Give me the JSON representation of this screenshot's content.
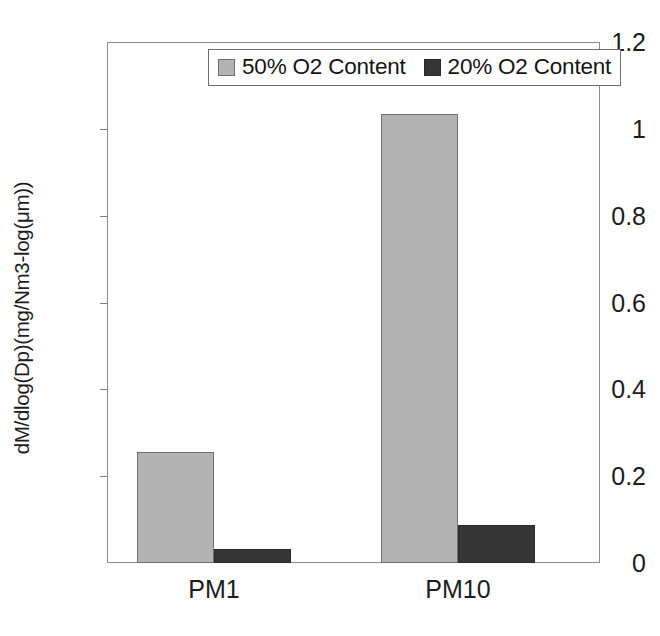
{
  "chart_data": {
    "type": "bar",
    "title": "",
    "xlabel": "",
    "ylabel": "dM/dlog(Dp)(mg/Nm3-log(μm))",
    "categories": [
      "PM1",
      "PM10"
    ],
    "series": [
      {
        "name": "50% O2 Content",
        "color": "#b3b3b3",
        "values": [
          0.255,
          1.035
        ]
      },
      {
        "name": "20% O2 Content",
        "color": "#353535",
        "values": [
          0.032,
          0.087
        ]
      }
    ],
    "ylim": [
      0,
      1.2
    ],
    "ytick_values": [
      0,
      0.2,
      0.4,
      0.6,
      0.8,
      1,
      1.2
    ],
    "ytick_labels": [
      "0",
      "0.2",
      "0.4",
      "0.6",
      "0.8",
      "1",
      "1.2"
    ],
    "grid": false,
    "legend_position": "top-center",
    "annotations": []
  },
  "legend": {
    "entries": [
      {
        "label": "50% O2 Content",
        "swatch": "legend-swatch-light-gray"
      },
      {
        "label": "20% O2 Content",
        "swatch": "legend-swatch-dark-gray"
      }
    ]
  }
}
